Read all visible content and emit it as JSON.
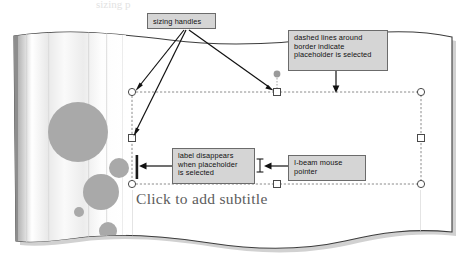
{
  "figure": {
    "kind": "annotated-screenshot",
    "top_partial_text": "sizing p"
  },
  "slide": {
    "subtitle_placeholder_text": "Click to add subtitle",
    "background_color": "#ffffff",
    "accent_shape_color": "#a9a9a9",
    "stripe_color": "#e8e8e8"
  },
  "selection": {
    "border_style": "dashed",
    "border_color": "#8c8c8c",
    "handle_fill": "#ffffff",
    "handle_stroke": "#4a4a4a",
    "rotation_handle_color": "#9a9a9a",
    "handles": [
      {
        "name": "top-left",
        "shape": "circle",
        "x": 132,
        "y": 92
      },
      {
        "name": "top-middle",
        "shape": "square",
        "x": 277,
        "y": 92
      },
      {
        "name": "top-right",
        "shape": "circle",
        "x": 421,
        "y": 92
      },
      {
        "name": "middle-left",
        "shape": "square",
        "x": 132,
        "y": 138
      },
      {
        "name": "middle-right",
        "shape": "square",
        "x": 421,
        "y": 138
      },
      {
        "name": "bottom-left",
        "shape": "circle",
        "x": 132,
        "y": 184
      },
      {
        "name": "bottom-middle",
        "shape": "square",
        "x": 277,
        "y": 184
      },
      {
        "name": "bottom-right",
        "shape": "circle",
        "x": 421,
        "y": 184
      }
    ],
    "rotation_handle": {
      "x": 277,
      "y": 74
    }
  },
  "cursors": {
    "ibeam_pointer": {
      "x": 260,
      "y": 165,
      "label": "I-beam mouse pointer"
    },
    "text_insertion_bar": {
      "x": 137,
      "y": 166
    }
  },
  "callouts": [
    {
      "id": "sizing-handles",
      "text": "sizing handles",
      "box": {
        "x": 147,
        "y": 13,
        "w": 69,
        "h": 16
      },
      "arrow_targets": [
        "top-left handle",
        "top-middle handle",
        "middle-left handle"
      ]
    },
    {
      "id": "dashed-lines",
      "text": "dashed lines around\nborder indicate\nplaceholder is selected",
      "box": {
        "x": 288,
        "y": 30,
        "w": 100,
        "h": 41
      },
      "arrow_targets": [
        "top dashed border"
      ]
    },
    {
      "id": "label-disappears",
      "text": "label disappears\nwhen placeholder\nis selected",
      "box": {
        "x": 172,
        "y": 148,
        "w": 83,
        "h": 36
      },
      "arrow_targets": [
        "text insertion bar"
      ]
    },
    {
      "id": "ibeam",
      "text": "I-beam mouse\npointer",
      "box": {
        "x": 288,
        "y": 155,
        "w": 78,
        "h": 26
      },
      "arrow_targets": [
        "I-beam cursor"
      ]
    }
  ],
  "paper": {
    "style": "torn wavy edges with drop shadow",
    "edge_color": "#3d3d3d",
    "shadow_color": "#bdbdbd"
  },
  "decor_circles": [
    {
      "cx": 78,
      "cy": 132,
      "r": 30
    },
    {
      "cx": 119,
      "cy": 168,
      "r": 10
    },
    {
      "cx": 101,
      "cy": 192,
      "r": 18
    },
    {
      "cx": 79,
      "cy": 212,
      "r": 5
    },
    {
      "cx": 108,
      "cy": 231,
      "r": 9
    }
  ]
}
